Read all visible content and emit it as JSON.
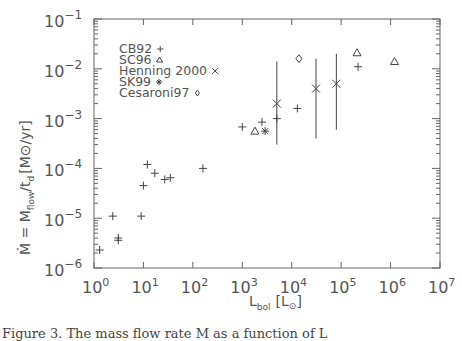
{
  "chart_data": {
    "type": "scatter",
    "title": "",
    "xlabel": "L_bol [L_sun]",
    "ylabel": "Ṁ = M_flow/t_d [M_sun/yr]",
    "xscale": "log",
    "yscale": "log",
    "xlim": [
      1,
      10000000
    ],
    "ylim": [
      1e-06,
      0.1
    ],
    "grid": false,
    "legend_position": "upper-left (inside)",
    "x_ticks": [
      {
        "base": "10",
        "exp": "0"
      },
      {
        "base": "10",
        "exp": "1"
      },
      {
        "base": "10",
        "exp": "2"
      },
      {
        "base": "10",
        "exp": "3"
      },
      {
        "base": "10",
        "exp": "4"
      },
      {
        "base": "10",
        "exp": "5"
      },
      {
        "base": "10",
        "exp": "6"
      },
      {
        "base": "10",
        "exp": "7"
      }
    ],
    "y_ticks": [
      {
        "base": "10",
        "exp": "−1"
      },
      {
        "base": "10",
        "exp": "−2"
      },
      {
        "base": "10",
        "exp": "−3"
      },
      {
        "base": "10",
        "exp": "−4"
      },
      {
        "base": "10",
        "exp": "−5"
      },
      {
        "base": "10",
        "exp": "−6"
      }
    ],
    "series": [
      {
        "name": "CB92",
        "marker": "+",
        "points": [
          [
            1.3,
            2.3e-06
          ],
          [
            2.4,
            1.1e-05
          ],
          [
            3.1,
            4e-06
          ],
          [
            3.1,
            3.6e-06
          ],
          [
            9,
            1.1e-05
          ],
          [
            10,
            4.5e-05
          ],
          [
            12,
            0.00012
          ],
          [
            17,
            8e-05
          ],
          [
            27,
            6e-05
          ],
          [
            35,
            6.5e-05
          ],
          [
            160,
            0.0001
          ],
          [
            1000,
            0.00068
          ],
          [
            2500,
            0.00085
          ],
          [
            5000,
            0.001
          ],
          [
            13000,
            0.0016
          ],
          [
            220000,
            0.011
          ]
        ]
      },
      {
        "name": "SC96",
        "marker": "triangle",
        "points": [
          [
            1800,
            0.00056
          ],
          [
            210000,
            0.021
          ],
          [
            1200000,
            0.014
          ]
        ]
      },
      {
        "name": "Henning 2000",
        "marker": "x",
        "points": [
          {
            "x": 5000,
            "y": 0.002,
            "err_low": 0.0003,
            "err_high": 0.014
          },
          {
            "x": 31000,
            "y": 0.004,
            "err_low": 0.0004,
            "err_high": 0.016
          },
          {
            "x": 80000,
            "y": 0.005,
            "err_low": 0.0006,
            "err_high": 0.02
          }
        ]
      },
      {
        "name": "SK99",
        "marker": "asterisk",
        "points": [
          [
            2900,
            0.00056
          ]
        ]
      },
      {
        "name": "Cesaroni97",
        "marker": "diamond",
        "points": [
          [
            14000,
            0.016
          ]
        ]
      }
    ]
  },
  "labels": {
    "x_axis_main": "L",
    "x_axis_sub": "bol",
    "x_axis_unit_open": "[",
    "x_axis_unit": "L",
    "x_axis_unit_sub": "⊙",
    "x_axis_unit_close": "]",
    "y_axis": "Ṁ = M",
    "y_axis_sub": "flow",
    "y_axis_mid": "/t",
    "y_axis_sub2": "d",
    "y_axis_unit": "[M⊙/yr]"
  },
  "legend": [
    {
      "label": "CB92",
      "symbol": "+"
    },
    {
      "label": "SC96",
      "symbol": "Δ"
    },
    {
      "label": "Henning 2000",
      "symbol": "×"
    },
    {
      "label": "SK99",
      "symbol": "*"
    },
    {
      "label": "Cesaroni97",
      "symbol": "◇"
    }
  ],
  "caption": "Figure 3.  The mass flow rate  M  as a function of  L"
}
